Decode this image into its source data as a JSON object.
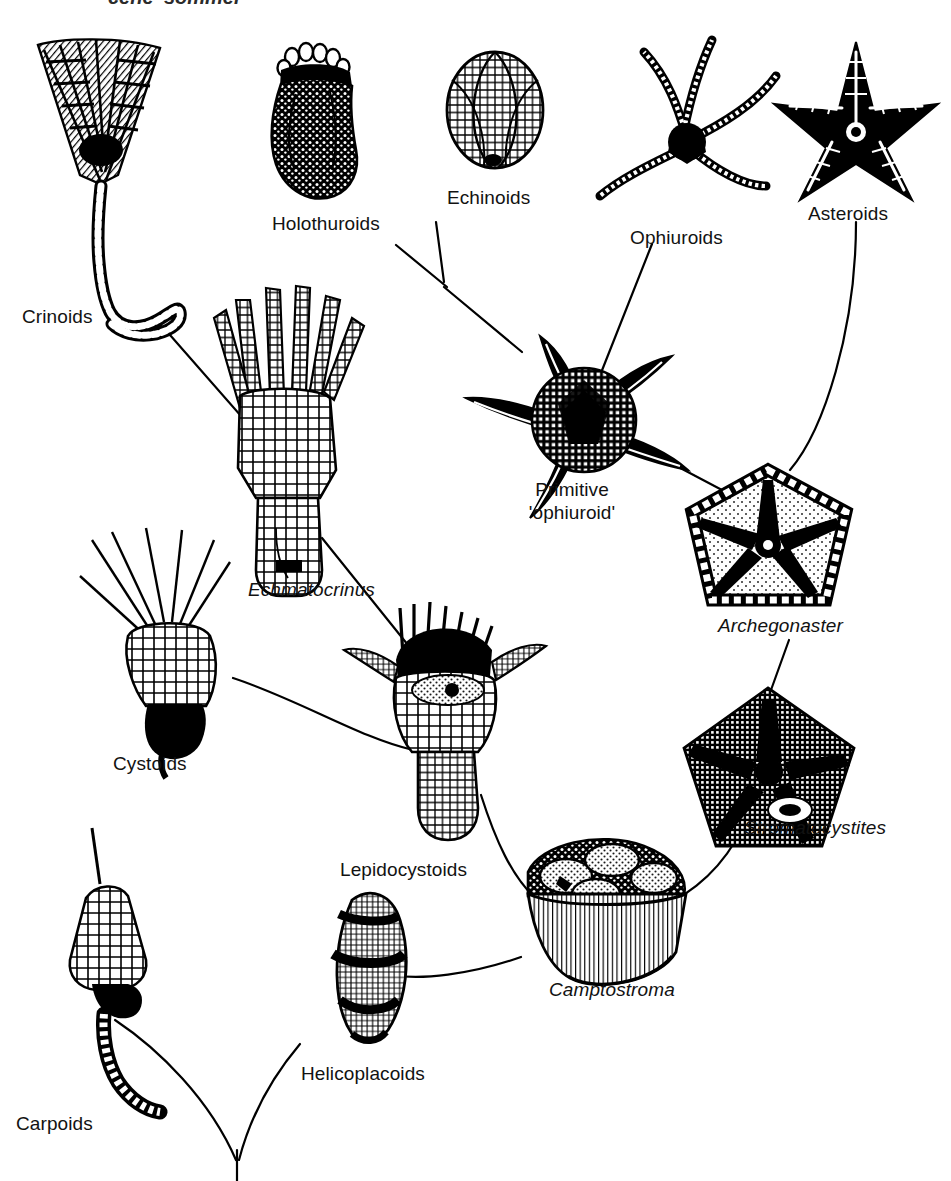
{
  "figure": {
    "kind": "phylogenetic-tree-diagram",
    "background_color": "#ffffff",
    "ink_color": "#000000",
    "cropped_header_text": "cene 'sommer"
  },
  "labels": {
    "crinoids": "Crinoids",
    "holothuroids": "Holothuroids",
    "echinoids": "Echinoids",
    "ophiuroids": "Ophiuroids",
    "asteroids": "Asteroids",
    "primitive_ophiuroid_line1": "Primitive",
    "primitive_ophiuroid_line2": "'ophiuroid'",
    "echmatocrinus": "Echmatocrinus",
    "archegonaster": "Archegonaster",
    "stromatocystites": "Stromatocystites",
    "cystoids": "Cystoids",
    "lepidocystoids": "Lepidocystoids",
    "camptostroma": "Camptostroma",
    "carpoids": "Carpoids",
    "helicoplacoids": "Helicoplacoids"
  },
  "taxa": [
    {
      "id": "crinoids",
      "label": "Crinoids",
      "italic": false,
      "x": 22,
      "y": 305,
      "align": "left"
    },
    {
      "id": "holothuroids",
      "label": "Holothuroids",
      "italic": false,
      "x": 272,
      "y": 212,
      "align": "left"
    },
    {
      "id": "echinoids",
      "label": "Echinoids",
      "italic": false,
      "x": 447,
      "y": 186,
      "align": "left"
    },
    {
      "id": "ophiuroids",
      "label": "Ophiuroids",
      "italic": false,
      "x": 630,
      "y": 226,
      "align": "left"
    },
    {
      "id": "asteroids",
      "label": "Asteroids",
      "italic": false,
      "x": 808,
      "y": 202,
      "align": "left"
    },
    {
      "id": "primitive",
      "label": "Primitive 'ophiuroid'",
      "italic": false,
      "x": 572,
      "y": 478,
      "align": "center"
    },
    {
      "id": "echmatocrinus",
      "label": "Echmatocrinus",
      "italic": true,
      "x": 248,
      "y": 578,
      "align": "left"
    },
    {
      "id": "archegonaster",
      "label": "Archegonaster",
      "italic": true,
      "x": 718,
      "y": 614,
      "align": "left"
    },
    {
      "id": "stromatocystites",
      "label": "Stromatocystites",
      "italic": true,
      "x": 744,
      "y": 816,
      "align": "left"
    },
    {
      "id": "cystoids",
      "label": "Cystoids",
      "italic": false,
      "x": 113,
      "y": 752,
      "align": "left"
    },
    {
      "id": "lepidocystoids",
      "label": "Lepidocystoids",
      "italic": false,
      "x": 340,
      "y": 858,
      "align": "left"
    },
    {
      "id": "camptostroma",
      "label": "Camptostroma",
      "italic": true,
      "x": 549,
      "y": 978,
      "align": "left"
    },
    {
      "id": "carpoids",
      "label": "Carpoids",
      "italic": false,
      "x": 16,
      "y": 1112,
      "align": "left"
    },
    {
      "id": "helicoplacoids",
      "label": "Helicoplacoids",
      "italic": false,
      "x": 301,
      "y": 1062,
      "align": "left"
    }
  ],
  "branches": [
    {
      "from": "crinoids",
      "to": "echmatocrinus"
    },
    {
      "from": "holothuroids",
      "to": "junction-holo-echino"
    },
    {
      "from": "echinoids",
      "to": "junction-holo-echino"
    },
    {
      "from": "junction-holo-echino",
      "to": "primitive"
    },
    {
      "from": "ophiuroids",
      "to": "primitive"
    },
    {
      "from": "asteroids",
      "to": "archegonaster"
    },
    {
      "from": "primitive",
      "to": "archegonaster"
    },
    {
      "from": "echmatocrinus",
      "to": "lepidocystoids"
    },
    {
      "from": "cystoids",
      "to": "lepidocystoids"
    },
    {
      "from": "archegonaster",
      "to": "stromatocystites"
    },
    {
      "from": "stromatocystites",
      "to": "camptostroma"
    },
    {
      "from": "lepidocystoids",
      "to": "camptostroma"
    },
    {
      "from": "camptostroma",
      "to": "helicoplacoids"
    },
    {
      "from": "helicoplacoids",
      "to": "root"
    },
    {
      "from": "carpoids",
      "to": "root"
    }
  ]
}
